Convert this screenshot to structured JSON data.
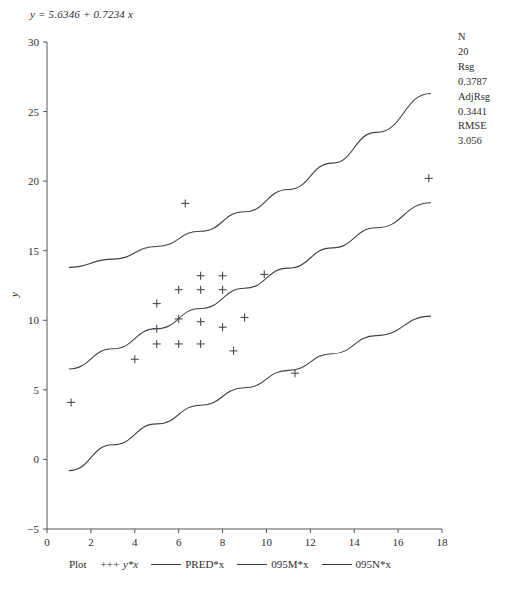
{
  "equation": {
    "lhs": "y",
    "text": "y = 5.6346 + 0.7234 x",
    "intercept": "5.6346",
    "slope": "0.7234"
  },
  "stats": {
    "n_label": "N",
    "n_value": "20",
    "rsq_label": "Rsg",
    "rsq_value": "0.3787",
    "adjrsq_label": "AdjRsg",
    "adjrsq_value": "0.3441",
    "rmse_label": "RMSE",
    "rmse_value": "3.056"
  },
  "legend": {
    "plot_label": "Plot",
    "marker_glyph": "+++",
    "marker_label": "y*x",
    "pred_label": "PRED*x",
    "upper_label": "095M*x",
    "lower_label": "095N*x"
  },
  "chart_data": {
    "type": "scatter",
    "title": "",
    "xlabel": "",
    "ylabel": "y",
    "xlim": [
      0,
      18
    ],
    "ylim": [
      -5,
      30
    ],
    "xticks": [
      0,
      2,
      4,
      6,
      8,
      10,
      12,
      14,
      16,
      18
    ],
    "yticks": [
      -5,
      0,
      5,
      10,
      15,
      20,
      25,
      30
    ],
    "grid": false,
    "legend_position": "bottom",
    "marker": "plus",
    "points": [
      {
        "x": 1.1,
        "y": 4.1
      },
      {
        "x": 4.0,
        "y": 7.2
      },
      {
        "x": 5.0,
        "y": 8.3
      },
      {
        "x": 5.0,
        "y": 9.4
      },
      {
        "x": 5.0,
        "y": 11.2
      },
      {
        "x": 6.0,
        "y": 8.3
      },
      {
        "x": 6.0,
        "y": 10.1
      },
      {
        "x": 6.0,
        "y": 12.2
      },
      {
        "x": 6.3,
        "y": 18.4
      },
      {
        "x": 7.0,
        "y": 8.3
      },
      {
        "x": 7.0,
        "y": 9.9
      },
      {
        "x": 7.0,
        "y": 12.2
      },
      {
        "x": 7.0,
        "y": 13.2
      },
      {
        "x": 8.0,
        "y": 9.5
      },
      {
        "x": 8.0,
        "y": 12.2
      },
      {
        "x": 8.0,
        "y": 13.2
      },
      {
        "x": 8.5,
        "y": 7.8
      },
      {
        "x": 9.0,
        "y": 10.2
      },
      {
        "x": 9.9,
        "y": 13.3
      },
      {
        "x": 11.3,
        "y": 6.2
      },
      {
        "x": 17.4,
        "y": 20.2
      }
    ],
    "series": [
      {
        "name": "PRED*x",
        "type": "line",
        "x": [
          1.0,
          3.0,
          5.0,
          7.0,
          9.0,
          11.0,
          13.0,
          15.0,
          17.5
        ],
        "y": [
          6.5,
          7.95,
          9.4,
          10.85,
          12.3,
          13.75,
          15.2,
          16.65,
          18.45
        ]
      },
      {
        "name": "095M*x",
        "type": "line",
        "x": [
          1.0,
          3.0,
          5.0,
          7.0,
          9.0,
          11.0,
          13.0,
          15.0,
          17.5
        ],
        "y": [
          13.8,
          14.4,
          15.3,
          16.4,
          17.8,
          19.4,
          21.3,
          23.5,
          26.3
        ]
      },
      {
        "name": "095N*x",
        "type": "line",
        "x": [
          1.0,
          3.0,
          5.0,
          7.0,
          9.0,
          11.0,
          13.0,
          15.0,
          17.5
        ],
        "y": [
          -0.8,
          1.05,
          2.55,
          3.9,
          5.15,
          6.4,
          7.6,
          8.9,
          10.3
        ]
      }
    ]
  }
}
